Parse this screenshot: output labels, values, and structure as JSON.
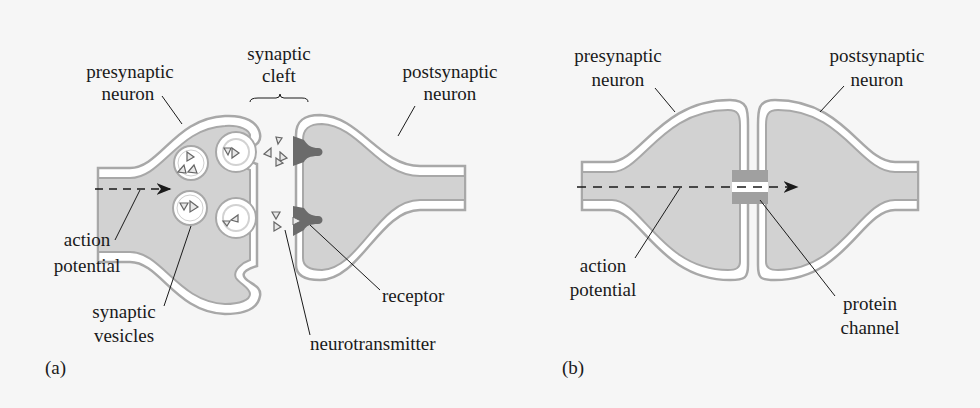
{
  "figure": {
    "panel_a": {
      "tag": "(a)",
      "labels": {
        "presynaptic_1": "presynaptic",
        "presynaptic_2": "neuron",
        "cleft_1": "synaptic",
        "cleft_2": "cleft",
        "postsynaptic_1": "postsynaptic",
        "postsynaptic_2": "neuron",
        "action_1": "action",
        "action_2": "potential",
        "vesicles_1": "synaptic",
        "vesicles_2": "vesicles",
        "receptor": "receptor",
        "neurotransmitter": "neurotransmitter"
      }
    },
    "panel_b": {
      "tag": "(b)",
      "labels": {
        "presynaptic_1": "presynaptic",
        "presynaptic_2": "neuron",
        "postsynaptic_1": "postsynaptic",
        "postsynaptic_2": "neuron",
        "action_1": "action",
        "action_2": "potential",
        "channel_1": "protein",
        "channel_2": "channel"
      }
    },
    "colors": {
      "cell_fill": "#d2d2d2",
      "membrane_outer": "#a8a8a8",
      "membrane_inner": "#ffffff",
      "receptor": "#6b6b6b",
      "text": "#1a1a1a"
    }
  }
}
